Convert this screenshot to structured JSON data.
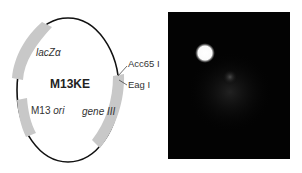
{
  "plasmid": {
    "name": "M13KE",
    "features": [
      {
        "label": "lacZα",
        "italic_part": "",
        "kind": "gene"
      },
      {
        "label": "M13 ",
        "italic_part": "ori",
        "kind": "origin"
      },
      {
        "label": "gene III",
        "italic_part": "gene III",
        "kind": "gene"
      }
    ],
    "sites": [
      "Acc65 I",
      "Eag I"
    ],
    "colors": {
      "backbone": "#111111",
      "feature": "#c8c8c8",
      "text": "#333333"
    }
  },
  "image_panel": {
    "description": "fluorescence micrograph",
    "colors": {
      "background": "#030303",
      "spot": "#ffffff"
    }
  }
}
